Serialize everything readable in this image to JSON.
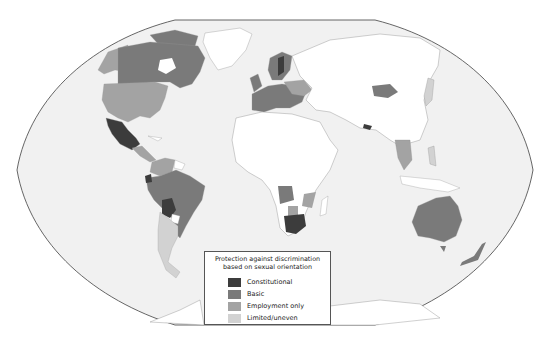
{
  "map": {
    "projection": "Winkel-tripel style world map",
    "background_color": "#f1f1f1",
    "outline_color": "#555555",
    "no_data_color": "#ffffff",
    "category_colors": {
      "constitutional": "#3c3c3c",
      "basic": "#7a7a7a",
      "employment_only": "#a3a3a3",
      "limited_uneven": "#d2d2d2"
    }
  },
  "legend": {
    "title_line1": "Protection against discrimination",
    "title_line2": "based on sexual orientation",
    "items": [
      {
        "label": "Constitutional",
        "color": "#3c3c3c"
      },
      {
        "label": "Basic",
        "color": "#7a7a7a"
      },
      {
        "label": "Employment only",
        "color": "#a3a3a3"
      },
      {
        "label": "Limited/uneven",
        "color": "#d2d2d2"
      }
    ]
  },
  "regions": [
    {
      "name": "Canada",
      "category": "basic"
    },
    {
      "name": "United States",
      "category": "employment_only"
    },
    {
      "name": "Alaska",
      "category": "employment_only"
    },
    {
      "name": "Mexico",
      "category": "constitutional"
    },
    {
      "name": "Central America",
      "category": "employment_only"
    },
    {
      "name": "Colombia / Venezuela",
      "category": "employment_only"
    },
    {
      "name": "Ecuador",
      "category": "constitutional"
    },
    {
      "name": "Brazil / Peru",
      "category": "basic"
    },
    {
      "name": "Bolivia",
      "category": "constitutional"
    },
    {
      "name": "Argentina / Chile",
      "category": "limited_uneven"
    },
    {
      "name": "Western Europe",
      "category": "basic"
    },
    {
      "name": "Sweden",
      "category": "constitutional"
    },
    {
      "name": "Eastern Europe",
      "category": "employment_only"
    },
    {
      "name": "Mongolia",
      "category": "basic"
    },
    {
      "name": "Nepal",
      "category": "constitutional"
    },
    {
      "name": "Angola",
      "category": "basic"
    },
    {
      "name": "Mozambique",
      "category": "employment_only"
    },
    {
      "name": "Botswana",
      "category": "employment_only"
    },
    {
      "name": "South Africa",
      "category": "constitutional"
    },
    {
      "name": "Australia",
      "category": "basic"
    },
    {
      "name": "New Zealand",
      "category": "basic"
    },
    {
      "name": "Thailand",
      "category": "employment_only"
    },
    {
      "name": "Japan / Philippines",
      "category": "limited_uneven"
    }
  ]
}
